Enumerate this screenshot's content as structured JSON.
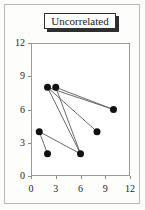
{
  "figure": {
    "title": "Uncorrelated",
    "background_color": "#fdfdfc",
    "frame_color": "#b8b8b4"
  },
  "chart_data": {
    "type": "scatter",
    "title": "Uncorrelated",
    "xlabel": "",
    "ylabel": "",
    "xlim": [
      0,
      12
    ],
    "ylim": [
      0,
      12
    ],
    "xticks": [
      0,
      3,
      6,
      9,
      12
    ],
    "yticks": [
      0,
      3,
      6,
      9,
      12
    ],
    "xtick_labels": [
      "0",
      "3",
      "6",
      "9",
      "12"
    ],
    "ytick_labels": [
      "0",
      "3",
      "6",
      "9",
      "12"
    ],
    "grid": false,
    "legend": null,
    "marker_color": "#111111",
    "marker_size": 7,
    "line_color": "#5a5a5a",
    "points": [
      {
        "id": "p1",
        "x": 2,
        "y": 8
      },
      {
        "id": "p2",
        "x": 3,
        "y": 8
      },
      {
        "id": "p3",
        "x": 10,
        "y": 6
      },
      {
        "id": "p4",
        "x": 8,
        "y": 4
      },
      {
        "id": "p5",
        "x": 1,
        "y": 4
      },
      {
        "id": "p6",
        "x": 2,
        "y": 2
      },
      {
        "id": "p7",
        "x": 6,
        "y": 2
      }
    ],
    "edges": [
      {
        "from": "p1",
        "to": "p3"
      },
      {
        "from": "p2",
        "to": "p3"
      },
      {
        "from": "p1",
        "to": "p4"
      },
      {
        "from": "p1",
        "to": "p7"
      },
      {
        "from": "p2",
        "to": "p7"
      },
      {
        "from": "p5",
        "to": "p6"
      },
      {
        "from": "p5",
        "to": "p7"
      }
    ]
  }
}
